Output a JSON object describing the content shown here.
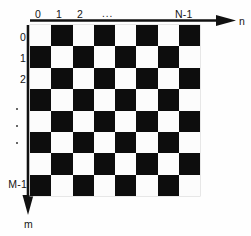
{
  "figure": {
    "type": "indexed-pixel-grid-diagram",
    "background_color": "#fefefe",
    "dark_cell_color": "#0d0d0d",
    "light_cell_color": "#fcfcfc"
  },
  "grid": {
    "rows": 8,
    "cols": 8,
    "top_left_cell": "light",
    "cells": [
      [
        "light",
        "dark",
        "light",
        "dark",
        "light",
        "dark",
        "light",
        "dark"
      ],
      [
        "dark",
        "light",
        "dark",
        "light",
        "dark",
        "light",
        "dark",
        "light"
      ],
      [
        "light",
        "dark",
        "light",
        "dark",
        "light",
        "dark",
        "light",
        "dark"
      ],
      [
        "dark",
        "light",
        "dark",
        "light",
        "dark",
        "light",
        "dark",
        "light"
      ],
      [
        "light",
        "dark",
        "light",
        "dark",
        "light",
        "dark",
        "light",
        "dark"
      ],
      [
        "dark",
        "light",
        "dark",
        "light",
        "dark",
        "light",
        "dark",
        "light"
      ],
      [
        "light",
        "dark",
        "light",
        "dark",
        "light",
        "dark",
        "light",
        "dark"
      ],
      [
        "dark",
        "light",
        "dark",
        "light",
        "dark",
        "light",
        "dark",
        "light"
      ]
    ]
  },
  "column_labels": {
    "first": "0",
    "second": "1",
    "third": "2",
    "ellipsis": "...",
    "last": "N-1"
  },
  "row_labels": {
    "first": "0",
    "second": "1",
    "third": "2",
    "last": "M-1"
  },
  "axes": {
    "horizontal": {
      "name": "n",
      "direction": "right",
      "icon": "arrow-right-icon"
    },
    "vertical": {
      "name": "m",
      "direction": "down",
      "icon": "arrow-down-icon"
    }
  }
}
